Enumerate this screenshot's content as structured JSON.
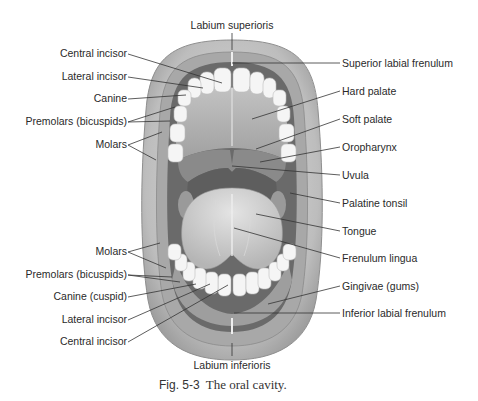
{
  "figure": {
    "caption_number": "Fig. 5-3",
    "caption_text": "The oral cavity.",
    "title": "The oral cavity"
  },
  "labels": {
    "top": {
      "labium_superioris": "Labium superioris"
    },
    "bottom": {
      "labium_inferioris": "Labium inferioris"
    },
    "left_upper": [
      {
        "id": "central-incisor-upper",
        "text": "Central incisor"
      },
      {
        "id": "lateral-incisor-upper",
        "text": "Lateral incisor"
      },
      {
        "id": "canine-upper",
        "text": "Canine"
      },
      {
        "id": "premolars-upper",
        "text": "Premolars (bicuspids)"
      },
      {
        "id": "molars-upper",
        "text": "Molars"
      }
    ],
    "left_lower": [
      {
        "id": "molars-lower",
        "text": "Molars"
      },
      {
        "id": "premolars-lower",
        "text": "Premolars (bicuspids)"
      },
      {
        "id": "canine-lower",
        "text": "Canine (cuspid)"
      },
      {
        "id": "lateral-incisor-lower",
        "text": "Lateral incisor"
      },
      {
        "id": "central-incisor-lower",
        "text": "Central incisor"
      }
    ],
    "right": [
      {
        "id": "superior-labial-frenulum",
        "text": "Superior labial frenulum"
      },
      {
        "id": "hard-palate",
        "text": "Hard palate"
      },
      {
        "id": "soft-palate",
        "text": "Soft palate"
      },
      {
        "id": "oropharynx",
        "text": "Oropharynx"
      },
      {
        "id": "uvula",
        "text": "Uvula"
      },
      {
        "id": "palatine-tonsil",
        "text": "Palatine tonsil"
      },
      {
        "id": "tongue",
        "text": "Tongue"
      },
      {
        "id": "frenulum-lingua",
        "text": "Frenulum lingua"
      },
      {
        "id": "gingivae",
        "text": "Gingivae (gums)"
      },
      {
        "id": "inferior-labial-frenulum",
        "text": "Inferior labial frenulum"
      }
    ]
  },
  "colors": {
    "background": "#ffffff",
    "lip_outer": "#b8b8b8",
    "lip_inner": "#cfcfcf",
    "mouth_dark": "#5a5a5a",
    "palate": "#a9a9a9",
    "soft_palate": "#8c8c8c",
    "oropharynx": "#6f6f6f",
    "tongue": "#c9c9c9",
    "teeth": "#f4f4f4",
    "leader_line": "#333333",
    "text": "#2a2a2a"
  }
}
